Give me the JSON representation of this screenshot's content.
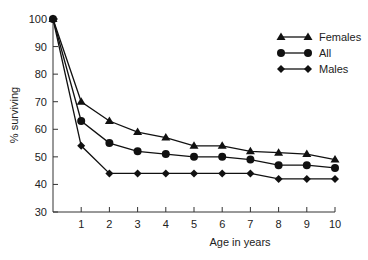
{
  "chart_data": {
    "type": "line",
    "title": "",
    "xlabel": "Age in years",
    "ylabel": "% surviving",
    "x": [
      0,
      1,
      2,
      3,
      4,
      5,
      6,
      7,
      8,
      9,
      10
    ],
    "x_ticks": [
      "1",
      "2",
      "3",
      "4",
      "5",
      "6",
      "7",
      "8",
      "9",
      "10"
    ],
    "y_ticks": [
      "30",
      "40",
      "50",
      "60",
      "70",
      "80",
      "90",
      "100"
    ],
    "ylim": [
      30,
      100
    ],
    "xlim": [
      0,
      10
    ],
    "grid": false,
    "legend_position": "upper right",
    "series": [
      {
        "name": "Females",
        "marker": "triangle",
        "values": [
          100,
          70,
          63,
          59,
          57,
          54,
          54,
          52,
          51.5,
          51,
          49
        ]
      },
      {
        "name": "All",
        "marker": "circle",
        "values": [
          100,
          63,
          55,
          52,
          51,
          50,
          50,
          49,
          47,
          47,
          46
        ]
      },
      {
        "name": "Males",
        "marker": "diamond",
        "values": [
          100,
          54,
          44,
          44,
          44,
          44,
          44,
          44,
          42,
          42,
          42
        ]
      }
    ]
  }
}
